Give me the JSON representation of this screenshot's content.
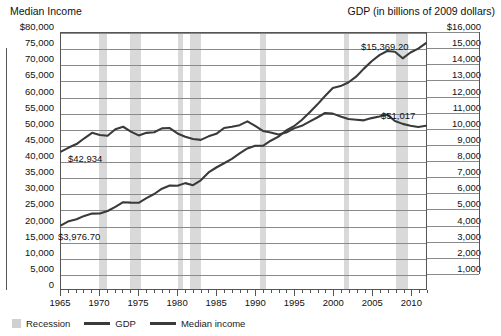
{
  "titles": {
    "left_axis": "Median Income",
    "right_axis": "GDP (in billions of 2009 dollars)"
  },
  "legend": {
    "recession": "Recession",
    "gdp": "GDP",
    "median_income": "Median income"
  },
  "annotations": {
    "median_start": "$42,934",
    "gdp_start": "$3,976.70",
    "gdp_end": "$15,369.20",
    "median_end": "$51,017"
  },
  "colors": {
    "line": "#3a3a3a",
    "recession": "#d9d9d9",
    "grid": "#8a8a8a",
    "frame": "#555555"
  },
  "chart_data": {
    "type": "line",
    "title": "",
    "xlabel": "",
    "ylabel": "Median Income",
    "y2label": "GDP (in billions of 2009 dollars)",
    "grid": true,
    "legend_position": "bottom-left",
    "xlim": [
      1965,
      2012
    ],
    "ylim": [
      0,
      80000
    ],
    "y2lim": [
      0,
      16000
    ],
    "yticks": [
      0,
      5000,
      10000,
      15000,
      20000,
      25000,
      30000,
      35000,
      40000,
      45000,
      50000,
      55000,
      60000,
      65000,
      70000,
      75000,
      80000
    ],
    "ytick_labels": [
      "0",
      "5,000",
      "10,000",
      "15,000",
      "20,000",
      "25,000",
      "30,000",
      "35,000",
      "40,000",
      "45,000",
      "50,000",
      "55,000",
      "60,000",
      "65,000",
      "70,000",
      "75,000",
      "$80,000"
    ],
    "y2ticks": [
      1000,
      2000,
      3000,
      4000,
      5000,
      6000,
      7000,
      8000,
      9000,
      10000,
      11000,
      12000,
      13000,
      14000,
      15000,
      16000
    ],
    "y2tick_labels": [
      "1,000",
      "2,000",
      "3,000",
      "4,000",
      "5,000",
      "6,000",
      "7,000",
      "8,000",
      "9,000",
      "10,000",
      "11,000",
      "12,000",
      "13,000",
      "14,000",
      "15,000",
      "$16,000"
    ],
    "xticks": [
      1965,
      1970,
      1975,
      1980,
      1985,
      1990,
      1995,
      2000,
      2005,
      2010
    ],
    "xtick_labels": [
      "1965",
      "1970",
      "1975",
      "1980",
      "1985",
      "1990",
      "1995",
      "2000",
      "2005",
      "2010"
    ],
    "x": [
      1965,
      1966,
      1967,
      1968,
      1969,
      1970,
      1971,
      1972,
      1973,
      1974,
      1975,
      1976,
      1977,
      1978,
      1979,
      1980,
      1981,
      1982,
      1983,
      1984,
      1985,
      1986,
      1987,
      1988,
      1989,
      1990,
      1991,
      1992,
      1993,
      1994,
      1995,
      1996,
      1997,
      1998,
      1999,
      2000,
      2001,
      2002,
      2003,
      2004,
      2005,
      2006,
      2007,
      2008,
      2009,
      2010,
      2011,
      2012
    ],
    "series": [
      {
        "name": "Median income",
        "axis": "left",
        "start_value": 42934,
        "end_value": 51017,
        "values": [
          42934,
          44200,
          45300,
          47100,
          48800,
          48100,
          47900,
          49900,
          50700,
          49200,
          48000,
          48800,
          49000,
          50200,
          50300,
          48600,
          47600,
          46900,
          46600,
          47700,
          48500,
          50300,
          50700,
          51200,
          52400,
          51000,
          49400,
          48900,
          48300,
          48900,
          50200,
          51000,
          52300,
          53600,
          55000,
          54800,
          53900,
          53100,
          52900,
          52700,
          53400,
          53900,
          54500,
          52500,
          51600,
          51000,
          50600,
          51017
        ]
      },
      {
        "name": "GDP",
        "axis": "right",
        "start_value": 3976.7,
        "end_value": 15369.2,
        "values": [
          3976.7,
          4238.9,
          4355.2,
          4569.0,
          4712.5,
          4722.0,
          4877.6,
          5134.3,
          5424.1,
          5396.0,
          5385.4,
          5675.4,
          5937.0,
          6267.2,
          6466.2,
          6450.4,
          6617.7,
          6491.3,
          6792.0,
          7285.0,
          7593.8,
          7860.5,
          8132.6,
          8474.5,
          8786.4,
          8955.0,
          8948.4,
          9266.6,
          9521.0,
          9905.4,
          10174.8,
          10561.0,
          11034.9,
          11525.9,
          12065.9,
          12559.7,
          12682.2,
          12908.8,
          13271.1,
          13773.5,
          14234.2,
          14613.8,
          14873.7,
          14830.4,
          14418.7,
          14783.8,
          15020.6,
          15369.2
        ]
      }
    ],
    "recessions": [
      {
        "start": 1969.9,
        "end": 1970.9
      },
      {
        "start": 1973.9,
        "end": 1975.2
      },
      {
        "start": 1980.0,
        "end": 1980.6
      },
      {
        "start": 1981.5,
        "end": 1982.9
      },
      {
        "start": 1990.5,
        "end": 1991.2
      },
      {
        "start": 2001.2,
        "end": 2001.9
      },
      {
        "start": 2007.9,
        "end": 2009.5
      }
    ]
  }
}
